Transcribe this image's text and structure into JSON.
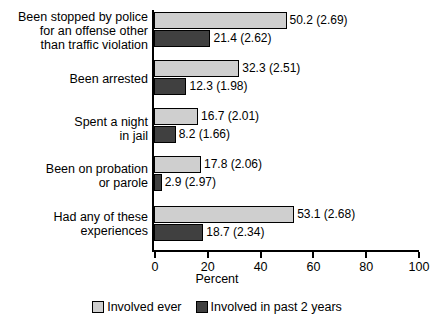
{
  "chart_data": {
    "type": "bar",
    "orientation": "horizontal",
    "title": "",
    "xlabel": "Percent",
    "ylabel": "",
    "xlim": [
      0,
      100
    ],
    "xticks": [
      0,
      20,
      40,
      60,
      80,
      100
    ],
    "xtick_labels": [
      "0",
      "20",
      "40",
      "60",
      "80",
      "100"
    ],
    "grid": false,
    "legend_position": "bottom-center",
    "categories": [
      "Been stopped by police for an offense other than traffic violation",
      "Been arrested",
      "Spent a night in jail",
      "Been on probation or parole",
      "Had any of these experiences"
    ],
    "category_lines": [
      [
        "Been stopped by police",
        "for an offense other",
        "than traffic violation"
      ],
      [
        "Been arrested"
      ],
      [
        "Spent a night",
        "in jail"
      ],
      [
        "Been on probation",
        "or parole"
      ],
      [
        "Had any of these",
        "experiences"
      ]
    ],
    "series": [
      {
        "name": "Involved ever",
        "color": "#cfcfcf",
        "values": [
          50.2,
          32.3,
          16.7,
          17.8,
          53.1
        ],
        "standard_errors": [
          2.69,
          2.51,
          2.01,
          2.06,
          2.68
        ],
        "data_labels": [
          "50.2 (2.69)",
          "32.3 (2.51)",
          "16.7 (2.01)",
          "17.8 (2.06)",
          "53.1 (2.68)"
        ]
      },
      {
        "name": "Involved in past 2 years",
        "color": "#404040",
        "values": [
          21.4,
          12.3,
          8.2,
          2.9,
          18.7
        ],
        "standard_errors": [
          2.62,
          1.98,
          1.66,
          2.97,
          2.34
        ],
        "data_labels": [
          "21.4 (2.62)",
          "12.3 (1.98)",
          "8.2 (1.66)",
          "2.9 (2.97)",
          "18.7 (2.34)"
        ]
      }
    ],
    "legend": [
      {
        "label": "Involved ever",
        "color": "#cfcfcf"
      },
      {
        "label": "Involved in past 2 years",
        "color": "#404040"
      }
    ]
  }
}
